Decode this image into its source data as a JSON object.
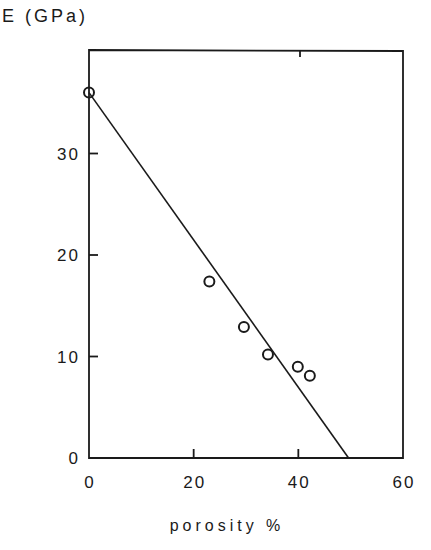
{
  "chart_data": {
    "type": "scatter",
    "title": "",
    "xlabel": "porosity %",
    "ylabel": "E (GPa)",
    "xlim": [
      0,
      60
    ],
    "ylim": [
      0,
      39
    ],
    "xticks": [
      0,
      20,
      40,
      60
    ],
    "yticks": [
      0,
      10,
      20,
      30
    ],
    "grid": false,
    "legend": null,
    "series": [
      {
        "name": "measured",
        "marker": "open-circle",
        "points": [
          {
            "x": 0,
            "y": 36
          },
          {
            "x": 23,
            "y": 17.4
          },
          {
            "x": 29.6,
            "y": 12.9
          },
          {
            "x": 34.2,
            "y": 10.2
          },
          {
            "x": 39.9,
            "y": 9.0
          },
          {
            "x": 42.2,
            "y": 8.1
          }
        ]
      },
      {
        "name": "linear fit",
        "style": "line",
        "points": [
          {
            "x": 0,
            "y": 36
          },
          {
            "x": 49.6,
            "y": 0
          }
        ]
      }
    ]
  },
  "labels": {
    "ylabel": "E (GPa)",
    "xlabel": "porosity %",
    "xtick_labels": [
      "0",
      "20",
      "40",
      "60"
    ],
    "ytick_labels": [
      "0",
      "10",
      "20",
      "30"
    ]
  },
  "colors": {
    "ink": "#1a1a1a",
    "background": "#ffffff"
  }
}
